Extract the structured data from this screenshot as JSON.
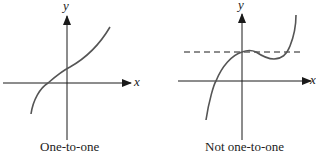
{
  "panels": [
    {
      "caption": "One-to-one",
      "x_axis_label": "x",
      "y_axis_label": "y",
      "curve": "increasing-curve",
      "horizontal_test_line": false
    },
    {
      "caption": "Not one-to-one",
      "x_axis_label": "x",
      "y_axis_label": "y",
      "curve": "cubic-with-local-max-and-min",
      "horizontal_test_line": true,
      "horizontal_test_line_style": "dashed"
    }
  ],
  "colors": {
    "axis": "#1a1a1a",
    "curve": "#555555",
    "dashed_line": "#1a1a1a",
    "background": "#ffffff"
  }
}
